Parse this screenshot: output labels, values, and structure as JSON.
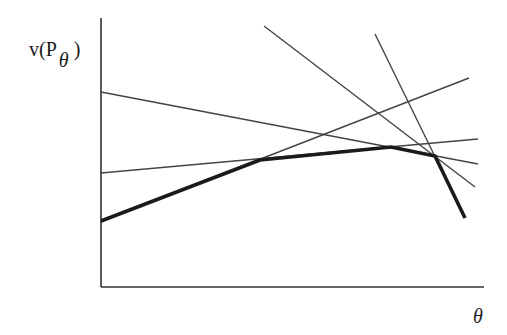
{
  "figure": {
    "y_axis_label": {
      "prefix": "v(P",
      "subscript": "θ",
      "suffix": ")"
    },
    "x_axis_label": "θ",
    "colors": {
      "background": "#ffffff",
      "axis": "#333333",
      "thin_line": "#444444",
      "envelope": "#1a1a1a"
    }
  },
  "diagram_data": {
    "type": "line",
    "description": "Piecewise-linear upper envelope (bold) of several linear functions of theta",
    "axes": {
      "origin": [
        101,
        287
      ],
      "y_top": [
        101,
        18
      ],
      "x_end": [
        484,
        287
      ]
    },
    "thin_lines": [
      {
        "name": "line-1",
        "from": [
          101,
          92
        ],
        "to": [
          478,
          164
        ]
      },
      {
        "name": "line-2",
        "from": [
          101,
          173
        ],
        "to": [
          478,
          139
        ]
      },
      {
        "name": "line-3",
        "from": [
          101,
          221
        ],
        "to": [
          469,
          78
        ]
      },
      {
        "name": "line-4",
        "from": [
          264,
          26
        ],
        "to": [
          475,
          187
        ]
      },
      {
        "name": "line-5",
        "from": [
          375,
          34
        ],
        "to": [
          465,
          218
        ]
      }
    ],
    "envelope": [
      [
        101,
        221
      ],
      [
        260,
        160
      ],
      [
        391,
        147
      ],
      [
        435,
        156
      ],
      [
        465,
        218
      ]
    ]
  }
}
